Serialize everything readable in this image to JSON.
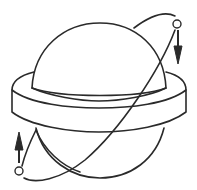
{
  "figure": {
    "colors": {
      "stroke": "#2a2a2a",
      "background": "#ffffff"
    },
    "elements": {
      "sphere": "oblate-planet-body",
      "band": "equatorial-bulge",
      "orbit": "inclined-orbit",
      "bodies": [
        {
          "position": "upper-right",
          "arrow": "down"
        },
        {
          "position": "lower-left",
          "arrow": "up"
        }
      ]
    }
  }
}
